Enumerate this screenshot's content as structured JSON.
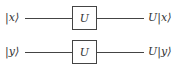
{
  "diagram": {
    "type": "quantum-circuit",
    "qubits": [
      {
        "input": "|x⟩",
        "gate": "U",
        "output": "U|x⟩"
      },
      {
        "input": "|y⟩",
        "gate": "U",
        "output": "U|y⟩"
      }
    ]
  }
}
